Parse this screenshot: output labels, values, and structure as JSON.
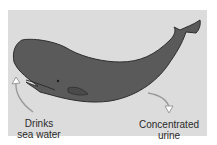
{
  "diagram": {
    "colors": {
      "background": "#dcdcdc",
      "whale_body": "#5a5a5a",
      "whale_outline": "#2e2e2e",
      "arrow": "#9a9a9a",
      "text": "#2a2a2a"
    },
    "labels": [
      {
        "id": "intake",
        "lines": [
          "Drinks",
          "sea water"
        ]
      },
      {
        "id": "output",
        "lines": [
          "Concentrated",
          "urine"
        ]
      }
    ]
  }
}
